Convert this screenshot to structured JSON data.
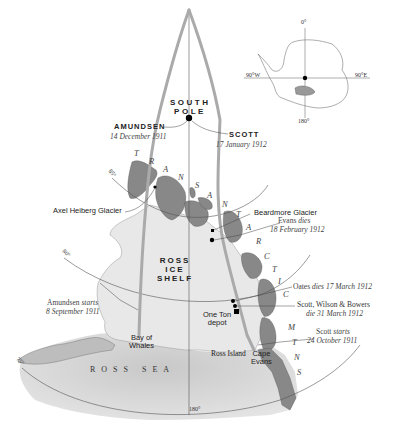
{
  "inset": {
    "labels": {
      "top": "0°",
      "left": "90°W",
      "right": "90°E",
      "bottom": "180°"
    }
  },
  "pole": {
    "line1": "SOUTH",
    "line2": "POLE"
  },
  "amundsen": {
    "name": "AMUNDSEN",
    "date": "14 December 1911"
  },
  "scott": {
    "name": "SCOTT",
    "date": "17 January 1912"
  },
  "shelf": {
    "line1": "ROSS",
    "line2": "ICE",
    "line3": "SHELF"
  },
  "sea": "ROSS SEA",
  "mountains": [
    "T",
    "R",
    "A",
    "N",
    "S",
    "A",
    "N",
    "T",
    "A",
    "R",
    "C",
    "T",
    "I",
    "C",
    "M",
    "T",
    "N",
    "S"
  ],
  "latitudes": {
    "l85": "85°",
    "l80": "80°",
    "l75": "75°"
  },
  "meridian": "180°",
  "places": {
    "axel": "Axel Heiberg Glacier",
    "beardmore": "Beardmore Glacier",
    "bay1": "Bay of",
    "bay2": "Whales",
    "ross_island": "Ross Island",
    "cape1": "Cape",
    "cape2": "Evans",
    "depot1": "One Ton",
    "depot2": "depot"
  },
  "events": {
    "evans_name": "Evans",
    "evans_dies": "dies",
    "evans_date": "18 February 1912",
    "oates_name": "Oates",
    "oates_dies": "dies",
    "oates_date": "17 March 1912",
    "swb_names": "Scott, Wilson & Bowers",
    "swb_date": "die 31 March 1912",
    "scott_start_name": "Scott",
    "scott_start_word": "starts",
    "scott_start_date": "24 October 1911",
    "amundsen_start_name": "Amundsen",
    "amundsen_start_word": "starts",
    "amundsen_start_date": "8 September 1911"
  },
  "colors": {
    "land": "#7d7d7d",
    "shelf": "#e4e4e4",
    "sea": "#cfcfcf",
    "route": "#a9a9a9",
    "line": "#555555"
  }
}
